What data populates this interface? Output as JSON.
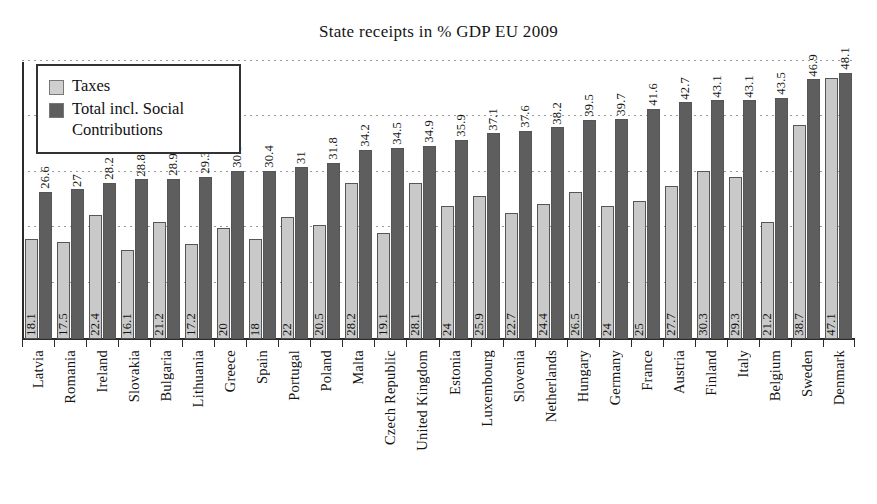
{
  "chart_data": {
    "type": "bar",
    "title": "State receipts in % GDP EU 2009",
    "xlabel": "",
    "ylabel": "",
    "ylim": [
      0,
      50
    ],
    "grid": true,
    "legend_position": "top-left",
    "categories": [
      "Latvia",
      "Romania",
      "Ireland",
      "Slovakia",
      "Bulgaria",
      "Lithuania",
      "Greece",
      "Spain",
      "Portugal",
      "Poland",
      "Malta",
      "Czech Republic",
      "United Kingdom",
      "Estonia",
      "Luxembourg",
      "Slovenia",
      "Netherlands",
      "Hungary",
      "Germany",
      "France",
      "Austria",
      "Finland",
      "Italy",
      "Belgium",
      "Sweden",
      "Denmark"
    ],
    "series": [
      {
        "name": "Taxes",
        "color": "#c9c9c9",
        "values": [
          18.1,
          17.5,
          22.4,
          16.1,
          21.2,
          17.2,
          20,
          18,
          22,
          20.5,
          28.2,
          19.1,
          28.1,
          24,
          25.9,
          22.7,
          24.4,
          26.5,
          24,
          25,
          27.7,
          30.3,
          29.3,
          21.2,
          38.7,
          47.1
        ],
        "labels": [
          "18.1",
          "17.5",
          "22.4",
          "16.1",
          "21.2",
          "17.2",
          "20",
          "18",
          "22",
          "20.5",
          "28.2",
          "19.1",
          "28.1",
          "24",
          "25.9",
          "22.7",
          "24.4",
          "26.5",
          "24",
          "25",
          "27.7",
          "30.3",
          "29.3",
          "21.2",
          "38.7",
          "47.1"
        ]
      },
      {
        "name": "Total incl. Social Contributions",
        "color": "#5e5e5e",
        "values": [
          26.6,
          27,
          28.2,
          28.8,
          28.9,
          29.3,
          30.3,
          30.4,
          31,
          31.8,
          34.2,
          34.5,
          34.9,
          35.9,
          37.1,
          37.6,
          38.2,
          39.5,
          39.7,
          41.6,
          42.7,
          43.1,
          43.1,
          43.5,
          46.9,
          48.1
        ],
        "labels": [
          "26.6",
          "27",
          "28.2",
          "28.8",
          "28.9",
          "29.3",
          "30.3",
          "30.4",
          "31",
          "31.8",
          "34.2",
          "34.5",
          "34.9",
          "35.9",
          "37.1",
          "37.6",
          "38.2",
          "39.5",
          "39.7",
          "41.6",
          "42.7",
          "43.1",
          "43.1",
          "43.5",
          "46.9",
          "48.1"
        ]
      }
    ],
    "gridline_values": [
      10,
      20,
      30,
      40,
      50
    ]
  },
  "legend": {
    "items": [
      {
        "label": "Taxes",
        "swatch": "taxes-swatch"
      },
      {
        "label": "Total incl. Social Contributions",
        "swatch": "total-swatch"
      }
    ]
  }
}
